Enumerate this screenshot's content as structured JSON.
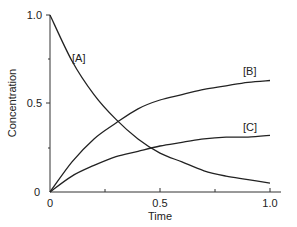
{
  "chart_data": {
    "type": "line",
    "title": "",
    "xlabel": "Time",
    "ylabel": "Concentration",
    "xlim": [
      0,
      1.0
    ],
    "ylim": [
      0,
      1.0
    ],
    "x_ticks": [
      "0",
      "0.5",
      "1.0"
    ],
    "y_ticks": [
      "0",
      "0.5",
      "1.0"
    ],
    "grid": false,
    "legend": "inline labels",
    "x": [
      0,
      0.1,
      0.2,
      0.3,
      0.4,
      0.5,
      0.6,
      0.7,
      0.8,
      0.9,
      1.0
    ],
    "series": [
      {
        "name": "[A]",
        "values": [
          1.0,
          0.74,
          0.55,
          0.41,
          0.3,
          0.22,
          0.17,
          0.12,
          0.09,
          0.07,
          0.05
        ]
      },
      {
        "name": "[B]",
        "values": [
          0.0,
          0.17,
          0.3,
          0.39,
          0.47,
          0.52,
          0.55,
          0.58,
          0.6,
          0.62,
          0.63
        ]
      },
      {
        "name": "[C]",
        "values": [
          0.0,
          0.09,
          0.15,
          0.2,
          0.23,
          0.26,
          0.28,
          0.3,
          0.31,
          0.31,
          0.32
        ]
      }
    ]
  },
  "labels": {
    "y_top": "1.0",
    "y_mid": "0.5",
    "y_zero": "0",
    "x_zero": "0",
    "x_mid": "0.5",
    "x_end": "1.0",
    "xlabel": "Time",
    "ylabel": "Concentration",
    "curve_a": "[A]",
    "curve_b": "[B]",
    "curve_c": "[C]"
  }
}
